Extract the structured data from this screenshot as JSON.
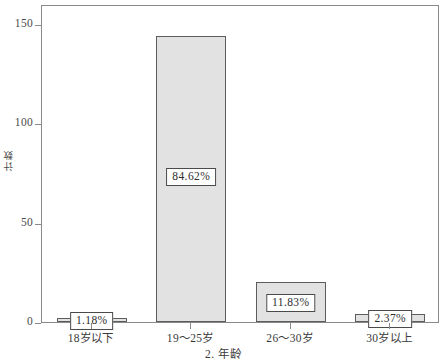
{
  "chart_data": {
    "type": "bar",
    "title": "",
    "subtitle": "",
    "xlabel": "2. 年龄",
    "ylabel": "计数",
    "categories": [
      "18岁以下",
      "19～25岁",
      "26～30岁",
      "30岁以上"
    ],
    "values": [
      2,
      144,
      20,
      4
    ],
    "data_labels": [
      "1.18%",
      "84.62%",
      "11.83%",
      "2.37%"
    ],
    "ylim": [
      0,
      160
    ],
    "ytick_values": [
      0,
      50,
      100,
      150
    ],
    "ytick_labels": [
      "0",
      "50",
      "100",
      "150"
    ],
    "grid": false,
    "legend": "none",
    "bar_fill_color": "#e2e2e2",
    "bar_border_color": "#5c5c5c",
    "axis_color": "#8a8a8a",
    "label_box_border_color": "#4a4a4a",
    "background_color": "#ffffff"
  },
  "axes": {
    "y": {
      "title": "计数",
      "ticks": [
        {
          "label": "150",
          "value": 150
        },
        {
          "label": "100",
          "value": 100
        },
        {
          "label": "50",
          "value": 50
        },
        {
          "label": "0",
          "value": 0
        }
      ]
    },
    "x": {
      "title": "2. 年龄",
      "ticks": [
        {
          "label": "18岁以下"
        },
        {
          "label": "19～25岁"
        },
        {
          "label": "26～30岁"
        },
        {
          "label": "30岁以上"
        }
      ]
    }
  },
  "bars": [
    {
      "category": "18岁以下",
      "value": 2,
      "label": "1.18%"
    },
    {
      "category": "19～25岁",
      "value": 144,
      "label": "84.62%"
    },
    {
      "category": "26～30岁",
      "value": 20,
      "label": "11.83%"
    },
    {
      "category": "30岁以上",
      "value": 4,
      "label": "2.37%"
    }
  ]
}
